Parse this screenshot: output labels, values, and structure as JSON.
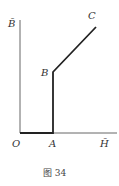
{
  "diagram": {
    "labels": {
      "y_axis": "B̄",
      "x_axis": "H̄",
      "origin": "O",
      "point_a": "A",
      "point_b": "B",
      "point_c": "C"
    },
    "caption": "图 34",
    "points": {
      "O": [
        20,
        133
      ],
      "A": [
        53,
        133
      ],
      "B": [
        53,
        72
      ],
      "C": [
        96,
        27
      ]
    },
    "colors": {
      "axis": "#555555",
      "curve": "#222222",
      "text": "#333333"
    }
  }
}
